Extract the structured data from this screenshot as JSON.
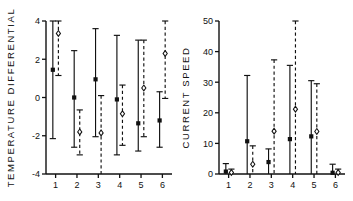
{
  "figure": {
    "background": "#ffffff",
    "ink": "#111111",
    "panels": [
      "temperature_differential",
      "current_speed"
    ]
  },
  "chart_data": [
    {
      "type": "scatter",
      "id": "temperature-differential",
      "title": "",
      "xlabel": "",
      "ylabel": "TEMPERATURE DIFFERENTIAL",
      "x": [
        1,
        2,
        3,
        4,
        5,
        6
      ],
      "xtick_labels": [
        "1",
        "2",
        "3",
        "4",
        "5",
        "6"
      ],
      "ytick_labels": [
        "-4",
        "-2",
        "0",
        "2",
        "4"
      ],
      "yticks": [
        -4,
        -2,
        0,
        2,
        4
      ],
      "ylim": [
        -4,
        4
      ],
      "xlim": [
        0.55,
        6.45
      ],
      "grid": false,
      "legend": "none",
      "series": [
        {
          "name": "solid",
          "linestyle": "solid",
          "marker": "filled-square",
          "offset": -0.13,
          "values": [
            1.45,
            0.0,
            0.95,
            -0.1,
            -1.35,
            -1.2
          ],
          "upper": [
            4.0,
            2.45,
            3.6,
            3.25,
            3.0,
            0.3
          ],
          "lower": [
            -2.15,
            -2.6,
            -2.05,
            -3.0,
            -2.8,
            -2.6
          ]
        },
        {
          "name": "dashed",
          "linestyle": "dashed",
          "marker": "open-diamond",
          "offset": 0.13,
          "values": [
            3.35,
            -1.8,
            -1.85,
            -0.85,
            0.5,
            2.3
          ],
          "upper": [
            4.0,
            -0.65,
            0.1,
            0.65,
            3.0,
            4.0
          ],
          "lower": [
            1.15,
            -3.0,
            -4.0,
            -2.5,
            -2.05,
            -0.05
          ]
        }
      ]
    },
    {
      "type": "scatter",
      "id": "current-speed",
      "title": "",
      "xlabel": "",
      "ylabel": "CURRENT SPEED",
      "x": [
        1,
        2,
        3,
        4,
        5,
        6
      ],
      "xtick_labels": [
        "1",
        "2",
        "3",
        "4",
        "5",
        "6"
      ],
      "ytick_labels": [
        "0",
        "10",
        "20",
        "30",
        "40",
        "50"
      ],
      "yticks": [
        0,
        10,
        20,
        30,
        40,
        50
      ],
      "ylim": [
        0,
        50
      ],
      "xlim": [
        0.55,
        6.45
      ],
      "grid": false,
      "legend": "none",
      "series": [
        {
          "name": "solid",
          "linestyle": "solid",
          "marker": "filled-square",
          "offset": -0.13,
          "values": [
            0.8,
            10.7,
            3.9,
            11.4,
            12.3,
            0.4
          ],
          "upper": [
            3.4,
            32.2,
            8.2,
            35.5,
            30.5,
            3.2
          ],
          "lower": [
            0.0,
            0.0,
            0.0,
            0.0,
            0.0,
            0.0
          ]
        },
        {
          "name": "dashed",
          "linestyle": "dashed",
          "marker": "open-diamond",
          "offset": 0.13,
          "values": [
            0.5,
            3.2,
            14.0,
            21.2,
            13.9,
            0.5
          ],
          "upper": [
            1.6,
            9.2,
            37.3,
            50.0,
            29.5,
            1.6
          ],
          "lower": [
            0.0,
            0.0,
            0.0,
            0.0,
            0.0,
            0.0
          ]
        }
      ]
    }
  ]
}
